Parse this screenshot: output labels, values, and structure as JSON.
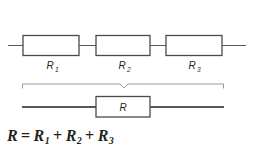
{
  "figure": {
    "type": "circuit-diagram",
    "colors": {
      "wire": "#58585a",
      "resistor_outline": "#4a4a4c",
      "resistor_fill": "#ffffff",
      "bracket": "#8d8d8f",
      "text": "#231f20",
      "background": "#ffffff"
    }
  },
  "series_circuit": {
    "name": "three-resistors-in-series",
    "resistors": [
      {
        "label_base": "R",
        "label_sub": "1",
        "label_full": "R1"
      },
      {
        "label_base": "R",
        "label_sub": "2",
        "label_full": "R2"
      },
      {
        "label_base": "R",
        "label_sub": "3",
        "label_full": "R3"
      }
    ]
  },
  "equivalent_circuit": {
    "name": "equivalent-resistor",
    "bracket_label": "",
    "resistor": {
      "label_base": "R",
      "label_sub": "",
      "label_full": "R"
    }
  },
  "equation": {
    "lhs": "R",
    "equals": "=",
    "terms": [
      {
        "base": "R",
        "sub": "1"
      },
      {
        "base": "R",
        "sub": "2"
      },
      {
        "base": "R",
        "sub": "3"
      }
    ],
    "operator": "+",
    "full_text": "R = R1 + R2 + R3"
  }
}
